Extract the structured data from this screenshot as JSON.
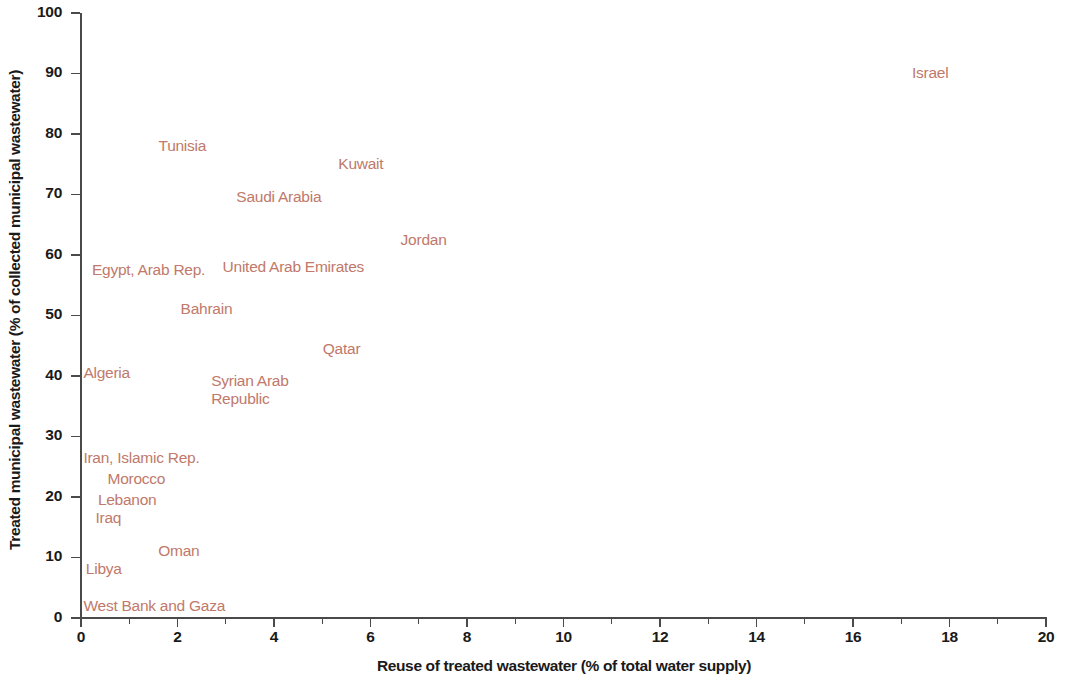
{
  "chart_data": {
    "type": "scatter",
    "title": "",
    "xlabel": "Reuse of treated wastewater (% of total water supply)",
    "ylabel": "Treated municipal wastewater (% of collected municipal wastewater)",
    "xlim": [
      0,
      20
    ],
    "ylim": [
      0,
      100
    ],
    "xticks": [
      0,
      2,
      4,
      6,
      8,
      10,
      12,
      14,
      16,
      18,
      20
    ],
    "xticklabels": [
      "0",
      "2",
      "4",
      "6",
      "8",
      "10",
      "12",
      "14",
      "16",
      "18",
      "20"
    ],
    "xminorticks": [
      1,
      3,
      5,
      7,
      9,
      11,
      13,
      15,
      17,
      19
    ],
    "yticks": [
      0,
      10,
      20,
      30,
      40,
      50,
      60,
      70,
      80,
      90,
      100
    ],
    "yticklabels": [
      "0",
      "10",
      "20",
      "30",
      "40",
      "50",
      "60",
      "70",
      "80",
      "90",
      "100"
    ],
    "grid": false,
    "legend": false,
    "marker_style": "text-label-only",
    "label_color": "#c0796a",
    "axis_color": "#4a4a4a",
    "text_color": "#1a1a1a",
    "background": "#ffffff",
    "points": [
      {
        "label": "Israel",
        "x": 17.6,
        "y": 90.0,
        "anchor": "center"
      },
      {
        "label": "Tunisia",
        "x": 2.1,
        "y": 78.0,
        "anchor": "center"
      },
      {
        "label": "Kuwait",
        "x": 5.8,
        "y": 75.0,
        "anchor": "center"
      },
      {
        "label": "Saudi Arabia",
        "x": 4.1,
        "y": 69.5,
        "anchor": "center"
      },
      {
        "label": "Jordan",
        "x": 7.1,
        "y": 62.5,
        "anchor": "center"
      },
      {
        "label": "United Arab Emirates",
        "x": 4.4,
        "y": 58.0,
        "anchor": "center"
      },
      {
        "label": "Egypt, Arab Rep.",
        "x": 1.4,
        "y": 57.5,
        "anchor": "center"
      },
      {
        "label": "Bahrain",
        "x": 2.6,
        "y": 51.0,
        "anchor": "center"
      },
      {
        "label": "Qatar",
        "x": 5.4,
        "y": 44.5,
        "anchor": "center"
      },
      {
        "label": "Algeria",
        "x": 0.05,
        "y": 40.5,
        "anchor": "left"
      },
      {
        "label": "Syrian Arab\nRepublic",
        "x": 3.5,
        "y": 39.0,
        "anchor": "center"
      },
      {
        "label": "Iran, Islamic Rep.",
        "x": 0.05,
        "y": 26.5,
        "anchor": "left"
      },
      {
        "label": "Morocco",
        "x": 0.55,
        "y": 23.0,
        "anchor": "left"
      },
      {
        "label": "Lebanon",
        "x": 0.35,
        "y": 19.5,
        "anchor": "left"
      },
      {
        "label": "Iraq",
        "x": 0.3,
        "y": 16.5,
        "anchor": "left"
      },
      {
        "label": "Oman",
        "x": 1.6,
        "y": 11.0,
        "anchor": "left"
      },
      {
        "label": "Libya",
        "x": 0.1,
        "y": 8.0,
        "anchor": "left"
      },
      {
        "label": "West Bank and Gaza",
        "x": 0.05,
        "y": 2.0,
        "anchor": "left"
      }
    ]
  }
}
